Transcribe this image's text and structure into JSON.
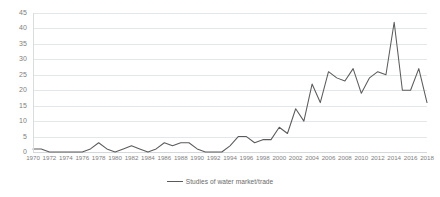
{
  "chart_data": {
    "type": "line",
    "title": "",
    "xlabel": "",
    "ylabel": "",
    "ylim": [
      0,
      45
    ],
    "ytick_step": 5,
    "yticks": [
      0,
      5,
      10,
      15,
      20,
      25,
      30,
      35,
      40,
      45
    ],
    "xlim": [
      1970,
      2018
    ],
    "xtick_step": 2,
    "grid": true,
    "legend_position": "bottom-center",
    "series_color": "#5b5b5b",
    "grid_color": "#e4e7ea",
    "tick_label_color": "#808080",
    "legend": [
      {
        "name": "Studies of water market/trade",
        "color": "#5b5b5b"
      }
    ],
    "xticks": [
      "1970",
      "1972",
      "1974",
      "1976",
      "1978",
      "1980",
      "1982",
      "1984",
      "1986",
      "1988",
      "1990",
      "1992",
      "1994",
      "1996",
      "1998",
      "2000",
      "2002",
      "2004",
      "2006",
      "2008",
      "2010",
      "2012",
      "2014",
      "2016",
      "2018"
    ],
    "x": [
      1970,
      1971,
      1972,
      1973,
      1974,
      1975,
      1976,
      1977,
      1978,
      1979,
      1980,
      1981,
      1982,
      1983,
      1984,
      1985,
      1986,
      1987,
      1988,
      1989,
      1990,
      1991,
      1992,
      1993,
      1994,
      1995,
      1996,
      1997,
      1998,
      1999,
      2000,
      2001,
      2002,
      2003,
      2004,
      2005,
      2006,
      2007,
      2008,
      2009,
      2010,
      2011,
      2012,
      2013,
      2014,
      2015,
      2016,
      2017,
      2018
    ],
    "values": [
      1,
      1,
      0,
      0,
      0,
      0,
      0,
      1,
      3,
      1,
      0,
      1,
      2,
      1,
      0,
      1,
      3,
      2,
      3,
      3,
      1,
      0,
      0,
      0,
      2,
      5,
      5,
      3,
      4,
      4,
      8,
      6,
      14,
      10,
      22,
      16,
      26,
      24,
      23,
      27,
      19,
      24,
      26,
      25,
      42,
      20,
      20,
      27,
      16
    ],
    "series": [
      {
        "name": "Studies of water market/trade",
        "color": "#5b5b5b",
        "values": [
          1,
          1,
          0,
          0,
          0,
          0,
          0,
          1,
          3,
          1,
          0,
          1,
          2,
          1,
          0,
          1,
          3,
          2,
          3,
          3,
          1,
          0,
          0,
          0,
          2,
          5,
          5,
          3,
          4,
          4,
          8,
          6,
          14,
          10,
          22,
          16,
          26,
          24,
          23,
          27,
          19,
          24,
          26,
          25,
          42,
          20,
          20,
          27,
          16
        ]
      }
    ]
  }
}
